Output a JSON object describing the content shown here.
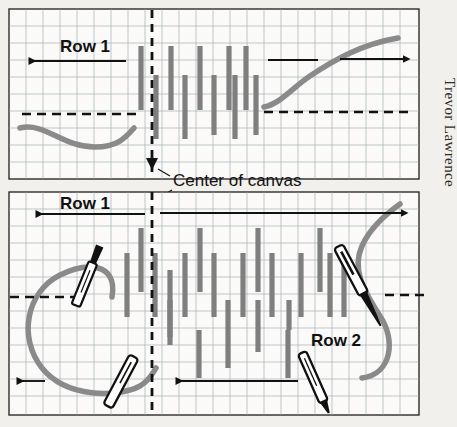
{
  "figure": {
    "kind": "embroidery-stitch-diagram",
    "credit": "Trevor Lawrence",
    "center_label": "Center of canvas",
    "background_color": "#f2f0ec",
    "grid_color": "#9aa3ae",
    "thread_color": "#8a8a8a",
    "ink_color": "#111111"
  },
  "panels": [
    {
      "id": "panel-top",
      "name": "row-1-panel",
      "labels": [
        {
          "text": "Row 1",
          "x": 60,
          "y": 46
        }
      ],
      "arrows": [
        {
          "name": "row1-left-arrow",
          "x1": 126,
          "y1": 61,
          "x2": 25,
          "y2": 61,
          "head": "left"
        },
        {
          "name": "thread-direction-arrow-short",
          "x1": 268,
          "y1": 60,
          "x2": 318,
          "y2": 60,
          "head": "none"
        },
        {
          "name": "thread-direction-arrow-right",
          "x1": 340,
          "y1": 59,
          "x2": 410,
          "y2": 59,
          "head": "right"
        }
      ],
      "dashed_lines": [
        {
          "name": "left-baseline",
          "x1": 22,
          "y1": 114,
          "x2": 137,
          "y2": 114
        },
        {
          "name": "right-baseline",
          "x1": 264,
          "y1": 112,
          "x2": 408,
          "y2": 112
        }
      ],
      "center_line": {
        "x": 152,
        "y1": 10,
        "y2": 178
      },
      "stitches_up": [
        141,
        171,
        200,
        229,
        246
      ],
      "stitches_down": [
        156,
        185,
        214,
        235,
        256
      ],
      "stitch_up_y": [
        46,
        110
      ],
      "stitch_down_y": [
        75,
        139
      ]
    },
    {
      "id": "panel-bottom",
      "name": "row-2-panel",
      "labels": [
        {
          "text": "Row 1",
          "x": 60,
          "y": 203
        },
        {
          "text": "Row 2",
          "x": 311,
          "y": 340
        }
      ],
      "arrows": [
        {
          "name": "row1-left-arrow",
          "x1": 145,
          "y1": 214,
          "x2": 32,
          "y2": 214,
          "head": "left"
        },
        {
          "name": "row2-right-arrow",
          "x1": 160,
          "y1": 213,
          "x2": 406,
          "y2": 213,
          "head": "right"
        },
        {
          "name": "row2-return-arrow",
          "x1": 298,
          "y1": 381,
          "x2": 172,
          "y2": 381,
          "head": "left"
        },
        {
          "name": "thread-tail-arrow",
          "x1": 45,
          "y1": 381,
          "x2": 13,
          "y2": 381,
          "head": "left"
        }
      ],
      "dashed_lines": [
        {
          "name": "left-baseline",
          "x1": 10,
          "y1": 297,
          "x2": 78,
          "y2": 297
        },
        {
          "name": "right-baseline",
          "x1": 385,
          "y1": 295,
          "x2": 427,
          "y2": 295
        }
      ],
      "center_line": {
        "x": 152,
        "y1": 192,
        "y2": 414
      },
      "needles": [
        {
          "name": "needle-upper-left",
          "x": 84,
          "y": 285,
          "angle": 22,
          "length": 74,
          "eye": "bottom"
        },
        {
          "name": "needle-upper-right",
          "x": 360,
          "y": 287,
          "angle": -28,
          "length": 84,
          "eye": "top"
        },
        {
          "name": "needle-lower-left",
          "x": 119,
          "y": 385,
          "angle": 28,
          "length": 60,
          "eye": "top"
        },
        {
          "name": "needle-lower-right",
          "x": 315,
          "y": 382,
          "angle": -24,
          "length": 62,
          "eye": "none"
        }
      ]
    }
  ]
}
